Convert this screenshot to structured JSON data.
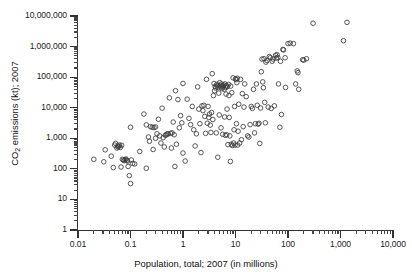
{
  "chart_data": {
    "type": "scatter",
    "title": "",
    "xlabel": "Population, total; 2007 (in millions)",
    "ylabel": "CO2 emissions (kt); 2007",
    "ylabel_html": "CO<sub>2</sub> emissions (kt); 2007",
    "xscale": "log",
    "yscale": "log",
    "xlim": [
      0.01,
      10000
    ],
    "ylim": [
      1,
      10000000
    ],
    "xticks": [
      0.01,
      0.1,
      1,
      10,
      100,
      1000,
      10000
    ],
    "xticklabels": [
      "0.01",
      "0.1",
      "1",
      "10",
      "100",
      "1,000",
      "10,000"
    ],
    "yticks": [
      1,
      10,
      100,
      1000,
      10000,
      100000,
      1000000,
      10000000
    ],
    "yticklabels": [
      "1",
      "10",
      "100",
      "1,000",
      "10,000",
      "100,000",
      "1,000,000",
      "10,000,000"
    ],
    "grid": false,
    "legend": null,
    "marker": "open-circle",
    "marker_color": "#3b3b3b",
    "marker_radius_px": 2.3,
    "n_points": 208,
    "points": [
      [
        0.02,
        205
      ],
      [
        0.031,
        170
      ],
      [
        0.033,
        420
      ],
      [
        0.043,
        260
      ],
      [
        0.047,
        110
      ],
      [
        0.05,
        600
      ],
      [
        0.052,
        680
      ],
      [
        0.055,
        480
      ],
      [
        0.057,
        560
      ],
      [
        0.058,
        520
      ],
      [
        0.06,
        550
      ],
      [
        0.062,
        600
      ],
      [
        0.064,
        500
      ],
      [
        0.066,
        115
      ],
      [
        0.068,
        590
      ],
      [
        0.07,
        205
      ],
      [
        0.073,
        195
      ],
      [
        0.076,
        185
      ],
      [
        0.079,
        200
      ],
      [
        0.082,
        210
      ],
      [
        0.085,
        190
      ],
      [
        0.088,
        180
      ],
      [
        0.09,
        120
      ],
      [
        0.095,
        60
      ],
      [
        0.1,
        2300
      ],
      [
        0.1,
        33
      ],
      [
        0.104,
        195
      ],
      [
        0.11,
        150
      ],
      [
        0.12,
        145
      ],
      [
        0.15,
        370
      ],
      [
        0.18,
        6200
      ],
      [
        0.2,
        2750
      ],
      [
        0.2,
        105
      ],
      [
        0.22,
        1100
      ],
      [
        0.23,
        800
      ],
      [
        0.24,
        2400
      ],
      [
        0.26,
        2300
      ],
      [
        0.27,
        430
      ],
      [
        0.28,
        2250
      ],
      [
        0.3,
        2350
      ],
      [
        0.3,
        1000
      ],
      [
        0.32,
        1400
      ],
      [
        0.34,
        4200
      ],
      [
        0.36,
        1200
      ],
      [
        0.38,
        700
      ],
      [
        0.4,
        9700
      ],
      [
        0.42,
        1050
      ],
      [
        0.44,
        520
      ],
      [
        0.46,
        1250
      ],
      [
        0.48,
        1300
      ],
      [
        0.5,
        1400
      ],
      [
        0.52,
        1380
      ],
      [
        0.55,
        21000
      ],
      [
        0.58,
        1450
      ],
      [
        0.6,
        480
      ],
      [
        0.62,
        1500
      ],
      [
        0.65,
        3400
      ],
      [
        0.68,
        1300
      ],
      [
        0.7,
        120
      ],
      [
        0.72,
        36000
      ],
      [
        0.75,
        640
      ],
      [
        0.8,
        18500
      ],
      [
        0.85,
        2200
      ],
      [
        0.9,
        5500
      ],
      [
        0.95,
        3200
      ],
      [
        1.0,
        62000
      ],
      [
        1.0,
        330
      ],
      [
        1.1,
        180
      ],
      [
        1.2,
        19000
      ],
      [
        1.3,
        4500
      ],
      [
        1.4,
        2800
      ],
      [
        1.5,
        11000
      ],
      [
        1.6,
        1900
      ],
      [
        1.7,
        560
      ],
      [
        1.8,
        1400
      ],
      [
        1.9,
        48000
      ],
      [
        2.0,
        9000
      ],
      [
        2.1,
        3000
      ],
      [
        2.2,
        340
      ],
      [
        2.3,
        11500
      ],
      [
        2.4,
        8000
      ],
      [
        2.5,
        12000
      ],
      [
        2.6,
        5200
      ],
      [
        2.7,
        1450
      ],
      [
        2.8,
        85000
      ],
      [
        2.9,
        3100
      ],
      [
        3.0,
        11000
      ],
      [
        3.1,
        4800
      ],
      [
        3.2,
        6200
      ],
      [
        3.3,
        2700
      ],
      [
        3.4,
        1550
      ],
      [
        3.5,
        7000
      ],
      [
        3.6,
        130000
      ],
      [
        3.7,
        4100
      ],
      [
        3.8,
        25000
      ],
      [
        3.9,
        62000
      ],
      [
        4.0,
        36000
      ],
      [
        4.1,
        50000
      ],
      [
        4.2,
        44000
      ],
      [
        4.3,
        1500
      ],
      [
        4.4,
        58000
      ],
      [
        4.5,
        52000
      ],
      [
        4.6,
        240
      ],
      [
        4.7,
        46000
      ],
      [
        4.8,
        30000
      ],
      [
        4.9,
        5800
      ],
      [
        5.0,
        66000
      ],
      [
        5.1,
        54000
      ],
      [
        5.2,
        48000
      ],
      [
        5.3,
        2200
      ],
      [
        5.4,
        60000
      ],
      [
        5.5,
        42000
      ],
      [
        5.6,
        52000
      ],
      [
        5.7,
        1350
      ],
      [
        5.8,
        47000
      ],
      [
        6.0,
        55000
      ],
      [
        6.1,
        40000
      ],
      [
        6.2,
        5000
      ],
      [
        6.3,
        60000
      ],
      [
        6.4,
        1250
      ],
      [
        6.5,
        46000
      ],
      [
        6.6,
        28000
      ],
      [
        6.7,
        53000
      ],
      [
        6.8,
        1300
      ],
      [
        6.9,
        9000
      ],
      [
        7.0,
        49000
      ],
      [
        7.2,
        620
      ],
      [
        7.4,
        58000
      ],
      [
        7.5,
        25000
      ],
      [
        7.6,
        4800
      ],
      [
        7.8,
        1200
      ],
      [
        8.0,
        175
      ],
      [
        8.1,
        51000
      ],
      [
        8.3,
        640
      ],
      [
        8.5,
        31000
      ],
      [
        8.7,
        580
      ],
      [
        9.0,
        95000
      ],
      [
        9.2,
        700
      ],
      [
        9.4,
        1900
      ],
      [
        9.6,
        11000
      ],
      [
        9.8,
        600
      ],
      [
        10.0,
        88000
      ],
      [
        10.2,
        83000
      ],
      [
        10.4,
        3000
      ],
      [
        10.6,
        66000
      ],
      [
        10.8,
        92000
      ],
      [
        11.0,
        600
      ],
      [
        11.2,
        1700
      ],
      [
        11.5,
        13000
      ],
      [
        12.0,
        700
      ],
      [
        12.5,
        85000
      ],
      [
        13.0,
        900
      ],
      [
        13.5,
        29000
      ],
      [
        14.0,
        2400
      ],
      [
        14.5,
        10500
      ],
      [
        15.0,
        60000
      ],
      [
        16.0,
        23000
      ],
      [
        17.0,
        1200
      ],
      [
        18.0,
        1100
      ],
      [
        19.0,
        2800
      ],
      [
        20.0,
        11000
      ],
      [
        21.0,
        9500
      ],
      [
        22.0,
        40000
      ],
      [
        23.0,
        1500
      ],
      [
        24.0,
        3000
      ],
      [
        25.0,
        60000
      ],
      [
        26.0,
        12000
      ],
      [
        27.0,
        2900
      ],
      [
        28.0,
        3100
      ],
      [
        29.0,
        680
      ],
      [
        30.0,
        9800
      ],
      [
        31.0,
        150000
      ],
      [
        32.0,
        390000
      ],
      [
        33.0,
        70000
      ],
      [
        34.0,
        45000
      ],
      [
        35.0,
        400000
      ],
      [
        36.0,
        15000
      ],
      [
        37.0,
        3200
      ],
      [
        38.0,
        310000
      ],
      [
        40.0,
        350000
      ],
      [
        42.0,
        10500
      ],
      [
        44.0,
        470000
      ],
      [
        46.0,
        430000
      ],
      [
        48.0,
        9500
      ],
      [
        50.0,
        330000
      ],
      [
        52.0,
        390000
      ],
      [
        55.0,
        11500
      ],
      [
        58.0,
        520000
      ],
      [
        60.0,
        420000
      ],
      [
        62.0,
        540000
      ],
      [
        64.0,
        440000
      ],
      [
        66.0,
        60000
      ],
      [
        70.0,
        2300
      ],
      [
        72.0,
        330000
      ],
      [
        75.0,
        6000
      ],
      [
        80.0,
        800000
      ],
      [
        82.0,
        780000
      ],
      [
        88.0,
        430000
      ],
      [
        90.0,
        46000
      ],
      [
        100.0,
        1250000
      ],
      [
        110.0,
        1300000
      ],
      [
        127.0,
        1250000
      ],
      [
        140.0,
        60000
      ],
      [
        150.0,
        160000
      ],
      [
        155.0,
        140000
      ],
      [
        160.0,
        40000
      ],
      [
        190.0,
        370000
      ],
      [
        200.0,
        360000
      ],
      [
        225.0,
        400000
      ],
      [
        300.0,
        5800000
      ],
      [
        1140.0,
        1550000
      ],
      [
        1330.0,
        6200000
      ]
    ]
  },
  "axis": {
    "y_title_prefix": "CO",
    "y_title_sub": "2",
    "y_title_suffix": " emissions (kt); 2007",
    "x_title": "Population, total; 2007 (in millions)"
  }
}
